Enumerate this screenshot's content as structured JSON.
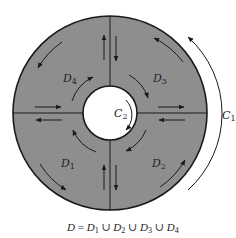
{
  "diagram": {
    "colors": {
      "region_fill": "#8e8e8e",
      "stroke": "#1a1a1a",
      "hole_fill": "#ffffff",
      "background": "#ffffff"
    },
    "regions": [
      {
        "id": "D1",
        "base": "D",
        "sub": "1",
        "quadrant": "bottom-left"
      },
      {
        "id": "D2",
        "base": "D",
        "sub": "2",
        "quadrant": "bottom-right"
      },
      {
        "id": "D3",
        "base": "D",
        "sub": "3",
        "quadrant": "top-right"
      },
      {
        "id": "D4",
        "base": "D",
        "sub": "4",
        "quadrant": "top-left"
      }
    ],
    "curves": [
      {
        "id": "C1",
        "base": "C",
        "sub": "1",
        "description": "outer boundary, counterclockwise"
      },
      {
        "id": "C2",
        "base": "C",
        "sub": "2",
        "description": "inner boundary, clockwise"
      }
    ],
    "caption": {
      "parts": [
        {
          "t": "D",
          "i": true
        },
        {
          "t": " = ",
          "i": false
        },
        {
          "t": "D",
          "i": true
        },
        {
          "t": "1",
          "s": true
        },
        {
          "t": " ∪ ",
          "i": false
        },
        {
          "t": "D",
          "i": true
        },
        {
          "t": "2",
          "s": true
        },
        {
          "t": " ∪ ",
          "i": false
        },
        {
          "t": "D",
          "i": true
        },
        {
          "t": "3",
          "s": true
        },
        {
          "t": " ∪ ",
          "i": false
        },
        {
          "t": "D",
          "i": true
        },
        {
          "t": "4",
          "s": true
        }
      ],
      "text": "D = D1 ∪ D2 ∪ D3 ∪ D4"
    }
  }
}
